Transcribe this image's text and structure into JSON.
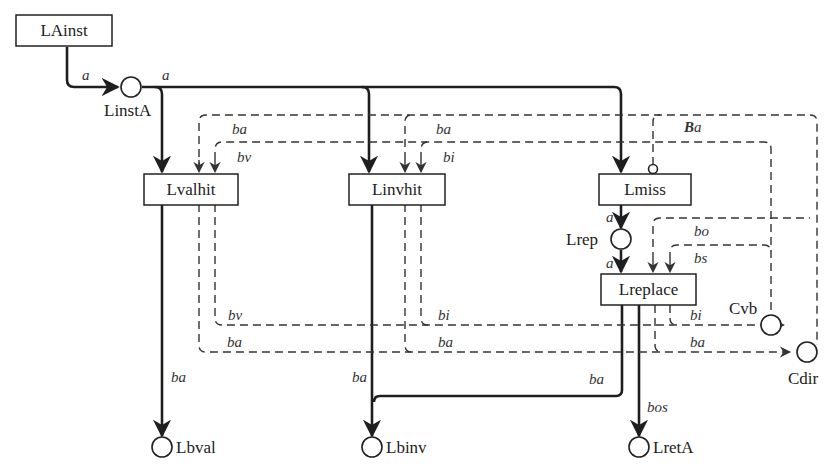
{
  "diagram": {
    "type": "petri-net",
    "transitions": [
      {
        "id": "LAinst",
        "label": "LAinst"
      },
      {
        "id": "Lvalhit",
        "label": "Lvalhit"
      },
      {
        "id": "Linvhit",
        "label": "Linvhit"
      },
      {
        "id": "Lmiss",
        "label": "Lmiss"
      },
      {
        "id": "Lreplace",
        "label": "Lreplace"
      }
    ],
    "places": [
      {
        "id": "LinstA",
        "label": "LinstA"
      },
      {
        "id": "Lrep",
        "label": "Lrep"
      },
      {
        "id": "Cvb",
        "label": "Cvb"
      },
      {
        "id": "Cdir",
        "label": "Cdir"
      },
      {
        "id": "Lbval",
        "label": "Lbval"
      },
      {
        "id": "Lbinv",
        "label": "Lbinv"
      },
      {
        "id": "LretA",
        "label": "LretA"
      }
    ],
    "arc_labels": {
      "a1": "a",
      "a2": "a",
      "a3": "a",
      "a4": "a",
      "ba_top_left": "ba",
      "bv_top": "bv",
      "ba_top_mid": "ba",
      "bi_top": "bi",
      "Ba_prefix": "B",
      "Ba_suffix": "a",
      "bo": "bo",
      "bs": "bs",
      "bv_bottom": "bv",
      "ba_bottom_left": "ba",
      "bi_bottom": "bi",
      "ba_bottom_mid": "ba",
      "bi_right": "bi",
      "ba_right": "ba",
      "ba_lbval": "ba",
      "ba_lbinv": "ba",
      "ba_replace": "ba",
      "bos": "bos"
    }
  }
}
